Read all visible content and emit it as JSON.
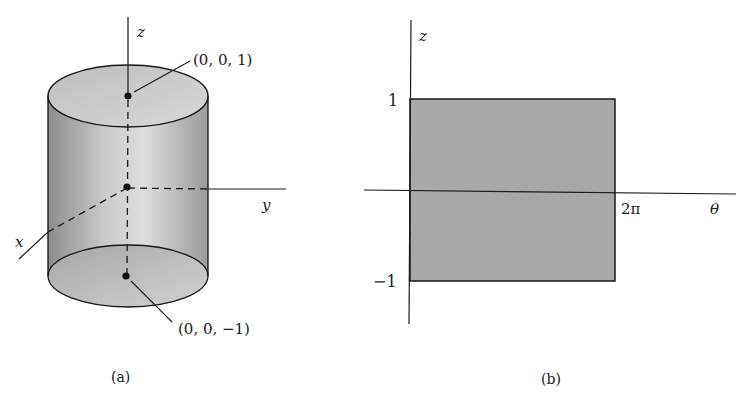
{
  "figure_a": {
    "caption": "(a)",
    "axes": {
      "x": "x",
      "y": "y",
      "z": "z"
    },
    "points": [
      {
        "label": "(0, 0, 1)",
        "coords": [
          0,
          0,
          1
        ]
      },
      {
        "label": "(0, 0, −1)",
        "coords": [
          0,
          0,
          -1
        ]
      }
    ],
    "shape": "cylinder",
    "colors": {
      "fill_light": "#d8d8d8",
      "fill_dark": "#8a8a8a",
      "stroke": "#1a1a1a"
    }
  },
  "figure_b": {
    "caption": "(b)",
    "axes": {
      "horizontal": "θ",
      "vertical": "z"
    },
    "ticks": {
      "z_top": "1",
      "z_bottom": "−1",
      "theta_right": "2π"
    },
    "region": {
      "theta_range": [
        0,
        "2π"
      ],
      "z_range": [
        -1,
        1
      ]
    },
    "colors": {
      "fill": "#a9a9a9",
      "stroke": "#1a1a1a"
    }
  }
}
